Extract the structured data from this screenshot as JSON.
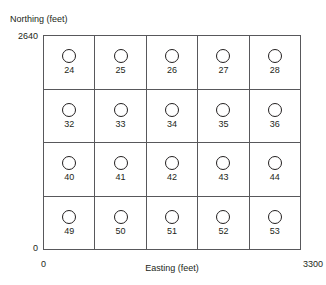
{
  "figure": {
    "axes": {
      "y_title": "Northing (feet)",
      "y_max_label": "2640",
      "y_min_label": "0",
      "x_title": "Easting (feet)",
      "x_min_label": "0",
      "x_max_label": "3300"
    },
    "symbol_name": "well-circle-icon",
    "colors": {
      "background": "#ffffff",
      "grid_line": "#58585b",
      "text": "#231f20",
      "symbol_stroke": "#231f20"
    },
    "grid": {
      "columns": 5,
      "rows": 4,
      "cells": [
        {
          "label": "24"
        },
        {
          "label": "25"
        },
        {
          "label": "26"
        },
        {
          "label": "27"
        },
        {
          "label": "28"
        },
        {
          "label": "32"
        },
        {
          "label": "33"
        },
        {
          "label": "34"
        },
        {
          "label": "35"
        },
        {
          "label": "36"
        },
        {
          "label": "40"
        },
        {
          "label": "41"
        },
        {
          "label": "42"
        },
        {
          "label": "43"
        },
        {
          "label": "44"
        },
        {
          "label": "49"
        },
        {
          "label": "50"
        },
        {
          "label": "51"
        },
        {
          "label": "52"
        },
        {
          "label": "53"
        }
      ]
    }
  }
}
